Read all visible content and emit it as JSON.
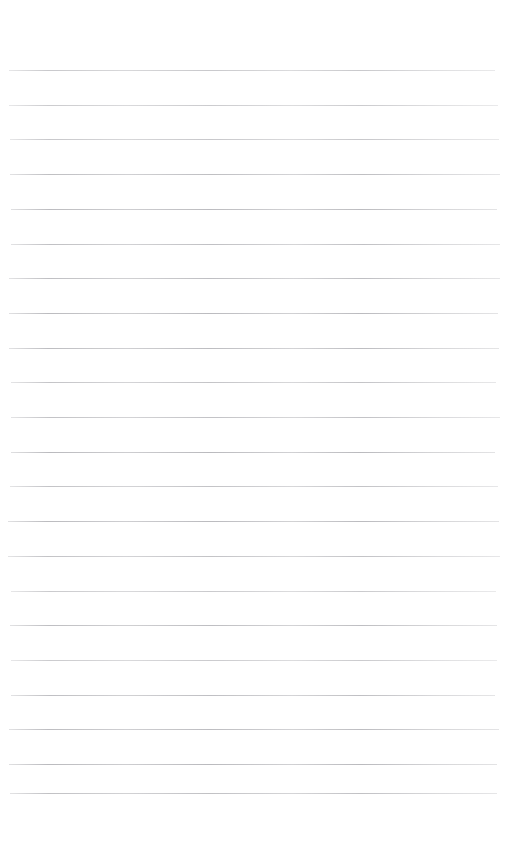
{
  "page": {
    "kind": "lined-paper",
    "width": 523,
    "height": 852,
    "background_color": "#ffffff",
    "has_text_content": false,
    "text_content": ""
  },
  "ruling": {
    "style": "horizontal-ruled",
    "line_color": "#b9b9bd",
    "line_thickness": 1,
    "line_spacing": 34.7,
    "line_left": 9,
    "line_right": 497,
    "line_width": 488,
    "first_line_y": 70,
    "last_line_y": 793,
    "line_count": 21,
    "margin_line_visible": false,
    "holes_visible": false,
    "line_y_positions": [
      70,
      104.7,
      139.4,
      174.1,
      208.8,
      243.5,
      278.2,
      312.9,
      347.6,
      382.3,
      417,
      451.7,
      486.4,
      521.1,
      555.8,
      590.5,
      625.2,
      659.9,
      694.6,
      729.3,
      764,
      793
    ]
  },
  "margins": {
    "top_margin_height": 70,
    "bottom_margin_height": 59,
    "left_margin_width": 9,
    "right_margin_width": 26
  }
}
